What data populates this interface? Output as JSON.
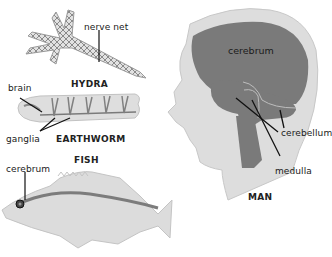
{
  "diagram": {
    "type": "comparative anatomy illustration of nervous systems",
    "colors": {
      "background": "#ffffff",
      "body_fill": "#dcdcdc",
      "nerve_fill": "#777777",
      "outline": "#bdbdbd",
      "leader_line": "#111111"
    },
    "organisms": [
      {
        "id": "hydra",
        "title": "HYDRA",
        "labels": [
          "nerve net"
        ]
      },
      {
        "id": "earthworm",
        "title": "EARTHWORM",
        "labels": [
          "brain",
          "ganglia"
        ]
      },
      {
        "id": "fish",
        "title": "FISH",
        "labels": [
          "cerebrum"
        ]
      },
      {
        "id": "man",
        "title": "MAN",
        "labels": [
          "cerebrum",
          "cerebellum",
          "medulla"
        ]
      }
    ]
  }
}
